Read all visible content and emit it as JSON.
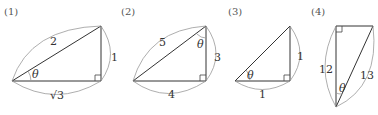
{
  "figures": [
    {
      "label": "(1)",
      "sides": {
        "hypotenuse": "2",
        "vertical": "1",
        "horizontal": "√3"
      },
      "angle": "θ"
    },
    {
      "label": "(2)",
      "sides": {
        "hypotenuse": "5",
        "vertical": "3",
        "horizontal": "4"
      },
      "angle": "θ"
    },
    {
      "label": "(3)",
      "sides": {
        "vertical": "1",
        "horizontal": "1"
      },
      "angle": "θ"
    },
    {
      "label": "(4)",
      "sides": {
        "vertical": "12",
        "hypotenuse": "13"
      },
      "angle": "θ"
    }
  ]
}
